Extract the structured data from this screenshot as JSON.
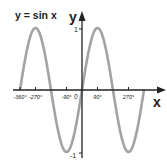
{
  "chart_data": {
    "type": "line",
    "title": "y = sin x",
    "xlabel": "x",
    "ylabel": "y",
    "origin_label": "0",
    "xlim": [
      -360,
      360
    ],
    "ylim": [
      -1,
      1
    ],
    "x_ticks": [
      "-360°",
      "-270°",
      "-90°",
      "90°",
      "270°"
    ],
    "x_tick_values": [
      -360,
      -270,
      -90,
      90,
      270
    ],
    "y_ticks": [
      "1",
      "-1"
    ],
    "y_tick_values": [
      1,
      -1
    ],
    "series": [
      {
        "name": "sin x",
        "function": "sin(x)",
        "x": [
          -360,
          -270,
          -180,
          -90,
          0,
          90,
          180,
          270,
          360
        ],
        "values": [
          0,
          1,
          0,
          -1,
          0,
          1,
          0,
          -1,
          0
        ]
      }
    ],
    "grid": false,
    "curve_color": "#a0a0a0",
    "axis_color": "#222222"
  }
}
